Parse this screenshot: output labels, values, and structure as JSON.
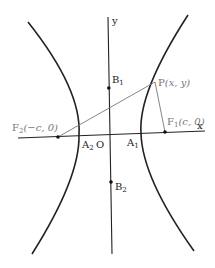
{
  "diagram": {
    "type": "hyperbola",
    "axes": {
      "x_label": "x",
      "y_label": "y",
      "origin_label": "O"
    },
    "points": {
      "P": {
        "name": "P",
        "coords": "(x, y)"
      },
      "F1": {
        "name": "F",
        "sub": "1",
        "coords": "(c, 0)"
      },
      "F2": {
        "name": "F",
        "sub": "2",
        "coords": "(−c, 0)"
      },
      "A1": {
        "name": "A",
        "sub": "1"
      },
      "A2": {
        "name": "A",
        "sub": "2"
      },
      "B1": {
        "name": "B",
        "sub": "1"
      },
      "B2": {
        "name": "B",
        "sub": "2"
      }
    },
    "segments": [
      "PF1",
      "PF2"
    ],
    "colors": {
      "curve": "#222222",
      "segments": "#777777",
      "background": "#ffffff"
    }
  }
}
